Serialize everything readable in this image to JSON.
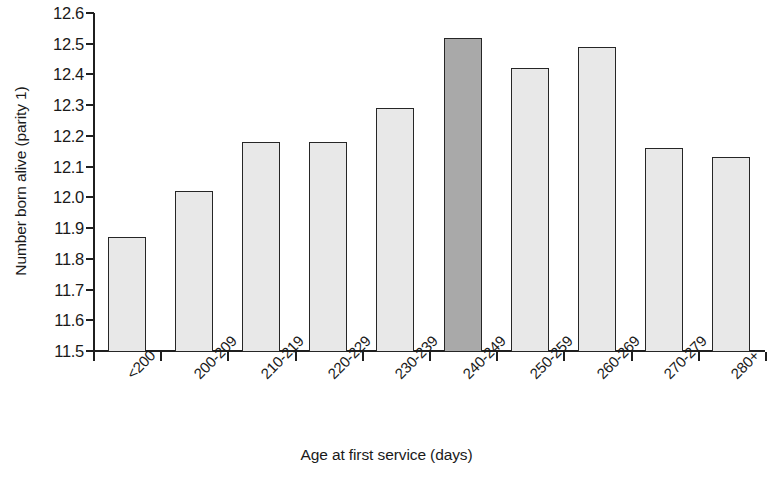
{
  "chart_data": {
    "type": "bar",
    "title": "",
    "xlabel": "Age at first service (days)",
    "ylabel": "Number born alive (parity 1)",
    "categories": [
      "<200",
      "200-209",
      "210-219",
      "220-229",
      "230-239",
      "240-249",
      "250-259",
      "260-269",
      "270-279",
      "280+"
    ],
    "values": [
      11.87,
      12.02,
      12.18,
      12.18,
      12.29,
      12.52,
      12.42,
      12.49,
      12.16,
      12.13
    ],
    "ylim": [
      11.5,
      12.6
    ],
    "ytick_step": 0.1,
    "ytick_labels": [
      "12.6",
      "12.5",
      "12.4",
      "12.3",
      "12.2",
      "12.1",
      "12.0",
      "11.9",
      "11.8",
      "11.7",
      "11.6",
      "11.5"
    ],
    "ytick_values": [
      12.6,
      12.5,
      12.4,
      12.3,
      12.2,
      12.1,
      12.0,
      11.9,
      11.8,
      11.7,
      11.6,
      11.5
    ],
    "grid": false,
    "legend": "none",
    "highlight_index": 5,
    "colors": {
      "bar_fill": "#e8e8e8",
      "bar_highlight_fill": "#a9a9a9",
      "bar_border": "#262626",
      "axis": "#1f1f1f",
      "text": "#1a1a1a",
      "background": "#ffffff"
    }
  }
}
